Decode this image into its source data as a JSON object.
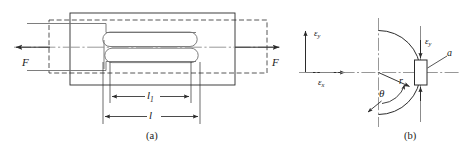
{
  "figure": {
    "background_color": "#ffffff",
    "line_color": "#2b2b2b",
    "light_line_color": "#8c8c8c",
    "panels": [
      {
        "id": "a",
        "caption": "(a)",
        "description": "Slotted tensile specimen loaded by force F at both ends",
        "labels": {
          "force_left": "F",
          "force_right": "F",
          "dim_inner_symbol": "l",
          "dim_inner_subscript": "1",
          "dim_outer_symbol": "l"
        }
      },
      {
        "id": "b",
        "caption": "(b)",
        "description": "Crack-tip region with polar coordinates and strain components",
        "labels": {
          "axis_vertical_symbol": "ε",
          "axis_vertical_subscript": "y",
          "axis_horizontal_symbol": "ε",
          "axis_horizontal_subscript": "x",
          "strain_arrow_symbol": "ε",
          "strain_arrow_subscript": "y",
          "radius": "r",
          "angle": "θ",
          "element": "a"
        }
      }
    ]
  }
}
